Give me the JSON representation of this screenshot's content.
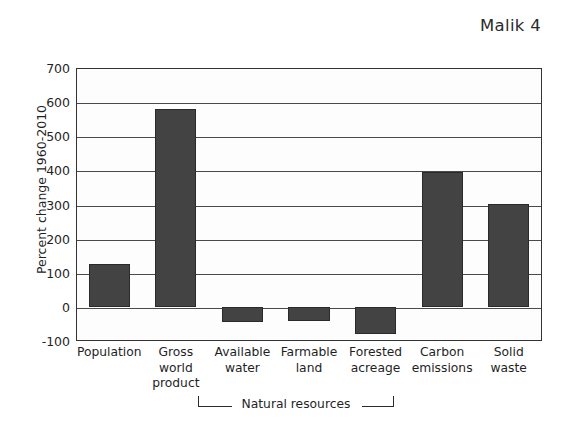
{
  "running_head": "Malik 4",
  "chart_data": {
    "type": "bar",
    "title": "",
    "xlabel": "",
    "ylabel": "Percent change 1960-2010",
    "ylim": [
      -100,
      700
    ],
    "ytick_step": 100,
    "yticks": [
      "700",
      "600",
      "500",
      "400",
      "300",
      "200",
      "100",
      "0",
      "-100"
    ],
    "grid": true,
    "legend": null,
    "categories": [
      "Population",
      "Gross world product",
      "Available water",
      "Farmable land",
      "Forested acreage",
      "Carbon emissions",
      "Solid waste"
    ],
    "category_lines": [
      [
        "Population"
      ],
      [
        "Gross",
        "world",
        "product"
      ],
      [
        "Available",
        "water"
      ],
      [
        "Farmable",
        "land"
      ],
      [
        "Forested",
        "acreage"
      ],
      [
        "Carbon",
        "emissions"
      ],
      [
        "Solid",
        "waste"
      ]
    ],
    "values": [
      125,
      580,
      -45,
      -40,
      -80,
      395,
      302
    ],
    "annotations": [
      {
        "text": "Natural resources",
        "spans_categories": [
          "Available water",
          "Farmable land",
          "Forested acreage"
        ],
        "style": "bracket-below-axis"
      }
    ],
    "colors": {
      "bar_fill": "#434343",
      "bar_edge": "#2a2a2a",
      "axis": "#333333",
      "grid": "#4a4a4a",
      "background": "#ffffff"
    }
  }
}
